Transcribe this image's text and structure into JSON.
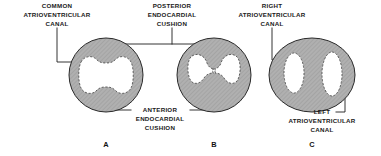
{
  "figure": {
    "background_color": "#ffffff",
    "tissue_fill_color": "#b3b3b3",
    "tissue_outline_color": "#2a2a2a",
    "lumen_fill_color": "#ffffff",
    "lumen_outline_color": "#4a4a4a",
    "leader_line_color": "#1d1d1d",
    "text_color": "#1a1a1a"
  },
  "labels": {
    "common_av_canal": {
      "lines": [
        "COMMON",
        "ATRIOVENTRICULAR",
        "CANAL"
      ],
      "points_to": "panel-a-lumen"
    },
    "posterior_endocardial_cushion": {
      "lines": [
        "POSTERIOR",
        "ENDOCARDIAL",
        "CUSHION"
      ],
      "points_to": "panel-a-and-b-superior-cushion"
    },
    "right_av_canal": {
      "lines": [
        "RIGHT",
        "ATRIOVENTRICULAR",
        "CANAL"
      ],
      "points_to": "panel-c-left-lumen"
    },
    "anterior_endocardial_cushion": {
      "lines": [
        "ANTERIOR",
        "ENDOCARDIAL",
        "CUSHION"
      ],
      "points_to": "panel-a-and-b-inferior-cushion"
    },
    "left_av_canal": {
      "lines": [
        "LEFT",
        "ATRIOVENTRICULAR",
        "CANAL"
      ],
      "points_to": "panel-c-right-lumen"
    }
  },
  "panels": [
    {
      "letter": "A",
      "caption": "COMMON ATRIOVENTRICULAR CANAL",
      "stage_description": "Single common canal; endocardial cushions just beginning to indent the lumen",
      "outline_shape": "circle",
      "lumen_count": 1,
      "lumen_shape": "horizontal dumbbell with shallow superior and inferior indentations"
    },
    {
      "letter": "B",
      "caption": "FUSING ENDOCARDIAL CUSHIONS",
      "stage_description": "Cushions approach each other, narrowing the lumen to a thin central channel",
      "outline_shape": "circle",
      "lumen_count": 1,
      "lumen_shape": "bilobed hourglass with narrow central isthmus"
    },
    {
      "letter": "C",
      "caption": "SEPARATE RIGHT AND LEFT CANALS",
      "stage_description": "Cushions fused; lumen divided into two separate canals",
      "outline_shape": "ellipse",
      "lumen_count": 2,
      "lumen_shape": "two vertical oval openings"
    }
  ],
  "panel_letters": [
    "A",
    "B",
    "C"
  ]
}
